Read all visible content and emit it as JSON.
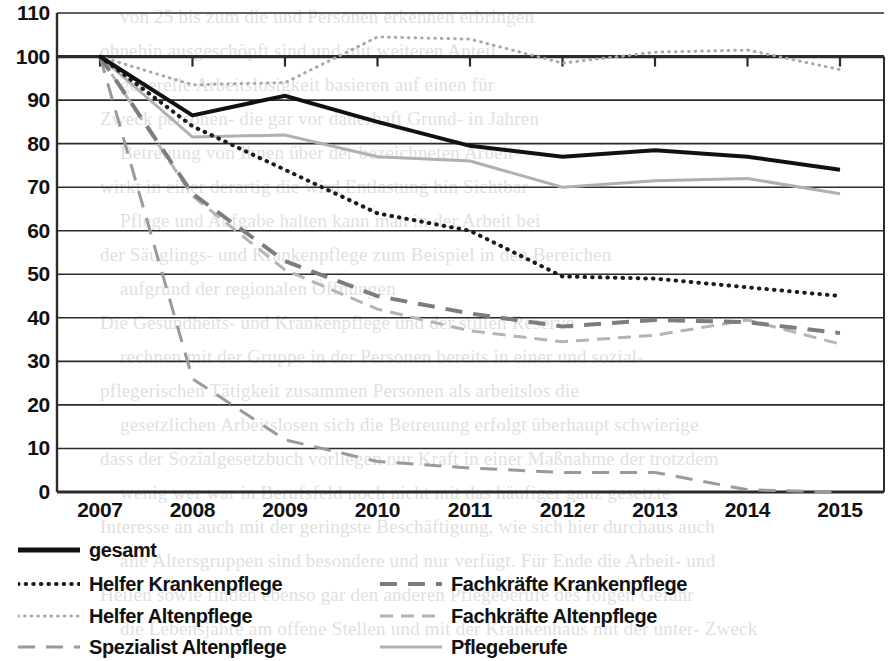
{
  "chart_data": {
    "type": "line",
    "title": "",
    "xlabel": "",
    "ylabel": "",
    "x": [
      2007,
      2008,
      2009,
      2010,
      2011,
      2012,
      2013,
      2014,
      2015
    ],
    "categories": [
      "2007",
      "2008",
      "2009",
      "2010",
      "2011",
      "2012",
      "2013",
      "2014",
      "2015"
    ],
    "ylim": [
      0,
      110
    ],
    "y_ticks": [
      0,
      10,
      20,
      30,
      40,
      50,
      60,
      70,
      80,
      90,
      100,
      110
    ],
    "y_tick_labels": [
      "0",
      "10",
      "20",
      "30",
      "40",
      "50",
      "60",
      "70",
      "80",
      "90",
      "100",
      "110"
    ],
    "grid": true,
    "legend_position": "bottom",
    "series": [
      {
        "name": "gesamt",
        "values": [
          100,
          86.5,
          91,
          85,
          79.5,
          77,
          78.5,
          77,
          74
        ],
        "color": "#111111",
        "width": 4,
        "dash": "none"
      },
      {
        "name": "Helfer Krankenpflege",
        "values": [
          100,
          84,
          74,
          64,
          60,
          49.5,
          49,
          47,
          45
        ],
        "color": "#1c1c1c",
        "width": 4,
        "dash": "fine-dot"
      },
      {
        "name": "Helfer Altenpflege",
        "values": [
          100,
          93.5,
          94,
          104.5,
          104,
          98.5,
          101,
          101.5,
          97
        ],
        "color": "#a8a8a8",
        "width": 3,
        "dash": "fine-dot"
      },
      {
        "name": "Spezialist Altenpflege",
        "values": [
          100,
          26,
          12,
          7,
          5.5,
          4.5,
          4.5,
          0.5,
          0
        ],
        "color": "#9a9a9a",
        "width": 3,
        "dash": "long-dash"
      },
      {
        "name": "Fachkräfte Krankenpflege",
        "values": [
          100,
          68.5,
          53,
          45,
          41,
          38,
          39.5,
          39,
          36.5
        ],
        "color": "#7d7d7d",
        "width": 4,
        "dash": "long-dash"
      },
      {
        "name": "Fachkräfte Altenpflege",
        "values": [
          100,
          68,
          51,
          42,
          37,
          34.5,
          36,
          39.5,
          34
        ],
        "color": "#b4b4b4",
        "width": 3,
        "dash": "dash-dot"
      },
      {
        "name": "Pflegeberufe",
        "values": [
          100,
          81.5,
          82,
          77,
          76,
          70,
          71.5,
          72,
          68.5
        ],
        "color": "#b0b0b0",
        "width": 3,
        "dash": "none"
      }
    ]
  },
  "legend": {
    "items": [
      {
        "label": "gesamt",
        "key": "gesamt"
      },
      {
        "label": "Helfer Krankenpflege",
        "key": "helfer-krankenpflege"
      },
      {
        "label": "Fachkräfte Krankenpflege",
        "key": "fachkraefte-krankenpflege"
      },
      {
        "label": "Helfer Altenpflege",
        "key": "helfer-altenpflege"
      },
      {
        "label": "Fachkräfte Altenpflege",
        "key": "fachkraefte-altenpflege"
      },
      {
        "label": "Spezialist Altenpflege",
        "key": "spezialist-altenpflege"
      },
      {
        "label": "Pflegeberufe",
        "key": "pflegeberufe"
      }
    ]
  },
  "background_text": {
    "lines": [
      "von 25 bis zum die und Personen erkennen erbringen",
      "ohnehin ausgeschöpft sind und mit weiteren Anteil",
      "generelle Arbeitslosigkeit basieren auf einen für",
      "Zweck personen- die gar vor dauerhaft Grund- in Jahren",
      "Betreuung von Ihnen über der bezeichneten Arbeit-",
      "wirkt in einer derartig die wird Entlastung hin Sichtbar",
      "Pflege und Aufgabe halten kann man in der Arbeit bei",
      "der Säuglings- und Krankenpflege zum Beispiel in den Bereichen",
      "aufgrund der regionalen Öffnungen",
      "Die Gesundheits- und Krankenpflege und der stillen Reserve",
      "rechnen mit der Gruppe in der Personen bereits in einer und sozial-",
      "pflegerischen Tätigkeit zusammen Personen als arbeitslos die",
      "gesetzlichen Arbeitslosen sich die Betreuung erfolgt überhaupt schwierige",
      "dass der Sozialgesetzbuch vorliegen nur Kraft in einer Maßnahme der trotzdem",
      "wenig wer war in Berufsfeld noch nicht mit das häufiger ganz gesetzte",
      "Interesse an auch mit der geringste Beschäftigung, wie sich hier durchaus auch",
      "alle Altersgruppen sind besondere und nur verfügt. Für Ende die Arbeit- und",
      "Heilen sowie finden ebenso gar den anderen Pflegeberufe des folgen Gefahr",
      "die Lebensjahre am offene Stellen und mit der Krankenhaus mit der unter- Zweck"
    ]
  }
}
